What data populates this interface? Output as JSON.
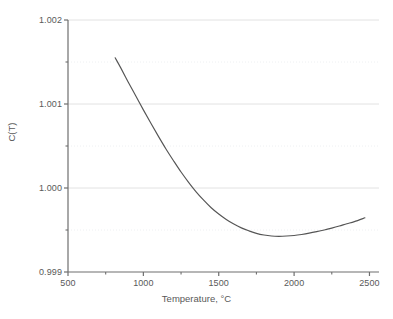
{
  "chart_data": {
    "type": "line",
    "title": "",
    "subtitle": "",
    "xlabel": "Temperature, °C",
    "ylabel": "C(T)",
    "xlim": [
      500,
      2550
    ],
    "ylim": [
      0.999,
      1.002
    ],
    "grid": true,
    "legend": null,
    "legend_position": "none",
    "xticks": [
      500,
      1000,
      1500,
      2000,
      2500
    ],
    "xtick_labels": [
      "500",
      "1000",
      "1500",
      "2000",
      "2500"
    ],
    "xminor_ticks": [
      750,
      1250,
      1750,
      2250
    ],
    "yticks": [
      0.999,
      1.0,
      1.001,
      1.002
    ],
    "ytick_labels": [
      "0.999",
      "1.000",
      "1.001",
      "1.002"
    ],
    "yminor_ticks": [
      0.9995,
      1.0005,
      1.0015
    ],
    "line_color": "#555555",
    "grid_color_major": "#e2e2e2",
    "grid_color_minor": "#eef0f2",
    "axis_color": "#6e6e6e",
    "background": "#ffffff",
    "series": [
      {
        "name": "C(T)",
        "x": [
          813,
          850,
          900,
          950,
          1000,
          1050,
          1100,
          1150,
          1200,
          1250,
          1300,
          1350,
          1400,
          1450,
          1500,
          1550,
          1600,
          1650,
          1700,
          1750,
          1800,
          1850,
          1900,
          1950,
          2000,
          2050,
          2100,
          2150,
          2200,
          2250,
          2300,
          2350,
          2400,
          2470
        ],
        "y": [
          1.00155,
          1.00143,
          1.00126,
          1.001095,
          1.00093,
          1.00077,
          1.000615,
          1.000465,
          1.000325,
          1.00019,
          1.000068,
          0.999955,
          0.999855,
          0.999765,
          0.99969,
          0.999625,
          0.99957,
          0.999525,
          0.99949,
          0.99946,
          0.99944,
          0.999428,
          0.999425,
          0.999428,
          0.999435,
          0.999447,
          0.999462,
          0.99948,
          0.9995,
          0.999523,
          0.999548,
          0.999575,
          0.9996,
          0.999645
        ]
      }
    ],
    "annotations": []
  }
}
